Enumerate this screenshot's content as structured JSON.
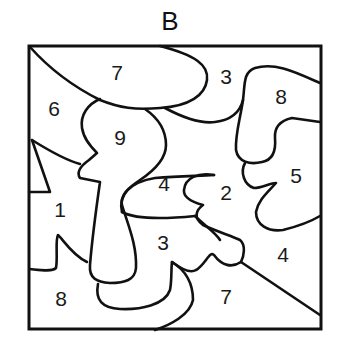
{
  "title": "B",
  "regions": [
    {
      "id": "r-7-top",
      "label": "7",
      "x": 117,
      "y": 80
    },
    {
      "id": "r-3-top",
      "label": "3",
      "x": 226,
      "y": 84
    },
    {
      "id": "r-8-top",
      "label": "8",
      "x": 281,
      "y": 104
    },
    {
      "id": "r-6",
      "label": "6",
      "x": 54,
      "y": 116
    },
    {
      "id": "r-9",
      "label": "9",
      "x": 120,
      "y": 145
    },
    {
      "id": "r-5",
      "label": "5",
      "x": 296,
      "y": 183
    },
    {
      "id": "r-4-mid",
      "label": "4",
      "x": 164,
      "y": 191
    },
    {
      "id": "r-2",
      "label": "2",
      "x": 226,
      "y": 200
    },
    {
      "id": "r-1",
      "label": "1",
      "x": 60,
      "y": 217
    },
    {
      "id": "r-3-mid",
      "label": "3",
      "x": 163,
      "y": 250
    },
    {
      "id": "r-4-right",
      "label": "4",
      "x": 283,
      "y": 262
    },
    {
      "id": "r-7-bottom",
      "label": "7",
      "x": 226,
      "y": 304
    },
    {
      "id": "r-8-bottom",
      "label": "8",
      "x": 61,
      "y": 306
    }
  ],
  "colors": {
    "stroke": "#111111",
    "background": "#ffffff"
  }
}
